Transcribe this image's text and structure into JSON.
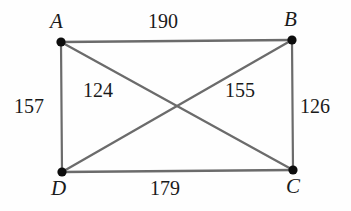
{
  "figure": {
    "type": "weighted-graph-diagram",
    "shape": "complete-graph-K4-on-rectangle",
    "background_color": "#fefefe",
    "edge_color": "#6b6b6b",
    "vertex_color": "#0d0d0d",
    "text_color": "#1a1a1a"
  },
  "vertices": [
    {
      "id": "A",
      "label": "A",
      "x": 61,
      "y": 42,
      "label_x": 50,
      "label_y": 11
    },
    {
      "id": "B",
      "label": "B",
      "x": 292,
      "y": 40,
      "label_x": 284,
      "label_y": 9
    },
    {
      "id": "C",
      "label": "C",
      "x": 293,
      "y": 170,
      "label_x": 286,
      "label_y": 176
    },
    {
      "id": "D",
      "label": "D",
      "x": 62,
      "y": 172,
      "label_x": 51,
      "label_y": 178
    }
  ],
  "edges": [
    {
      "id": "AB",
      "from": "A",
      "to": "B",
      "weight": "190",
      "label_x": 148,
      "label_y": 11
    },
    {
      "id": "BC",
      "from": "B",
      "to": "C",
      "weight": "126",
      "label_x": 300,
      "label_y": 96
    },
    {
      "id": "DC",
      "from": "D",
      "to": "C",
      "weight": "179",
      "label_x": 150,
      "label_y": 178
    },
    {
      "id": "AD",
      "from": "A",
      "to": "D",
      "weight": "157",
      "label_x": 14,
      "label_y": 96
    },
    {
      "id": "AC",
      "from": "A",
      "to": "C",
      "weight": "124",
      "label_x": 83,
      "label_y": 80
    },
    {
      "id": "DB",
      "from": "D",
      "to": "B",
      "weight": "155",
      "label_x": 225,
      "label_y": 80
    }
  ]
}
